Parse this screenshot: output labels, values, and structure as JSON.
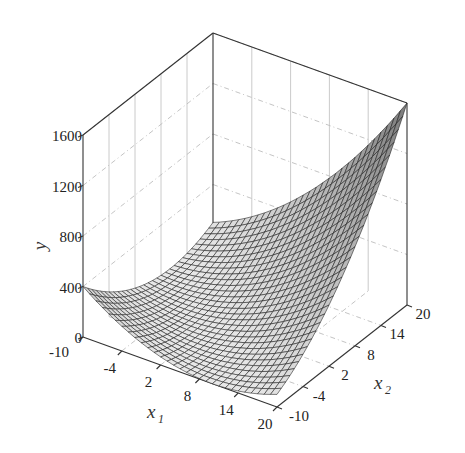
{
  "chart_data": {
    "type": "surface3d",
    "title": "",
    "function": "y = (x1 + x2)^2",
    "xlabel": "x1",
    "x2label": "x2",
    "ylabel": "y",
    "x1_ticks": [
      -10,
      -4,
      2,
      8,
      14,
      20
    ],
    "x2_ticks": [
      -10,
      -4,
      2,
      8,
      14,
      20
    ],
    "y_ticks": [
      0,
      400,
      800,
      1200,
      1600
    ],
    "x1_range": [
      -10,
      20
    ],
    "x2_range": [
      -10,
      20
    ],
    "y_range": [
      0,
      1600
    ],
    "grid": true,
    "mesh_resolution": 30,
    "sample_points": [
      {
        "x1": -10,
        "x2": -10,
        "y": 400
      },
      {
        "x1": 20,
        "x2": -10,
        "y": 100
      },
      {
        "x1": -10,
        "x2": 20,
        "y": 100
      },
      {
        "x1": 5,
        "x2": 5,
        "y": 100
      },
      {
        "x1": 20,
        "x2": 20,
        "y": 1600
      }
    ],
    "colors": {
      "surface_light": "#e6e6e6",
      "surface_dark": "#8c8c8c",
      "mesh": "#1a1a1a",
      "box": "#333333",
      "grid": "#bdbdbd"
    }
  },
  "labels": {
    "y_axis": "y",
    "x1_main": "x",
    "x1_sub": "1",
    "x2_main": "x",
    "x2_sub": "2",
    "y_ticks": [
      "0",
      "400",
      "800",
      "1200",
      "1600"
    ],
    "x1_ticks": [
      "-10",
      "-4",
      "2",
      "8",
      "14",
      "20"
    ],
    "x2_ticks": [
      "-10",
      "-4",
      "2",
      "8",
      "14",
      "20"
    ]
  }
}
